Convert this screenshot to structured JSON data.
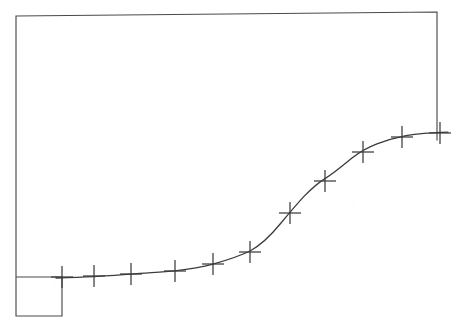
{
  "figure": {
    "title": "",
    "subtitle": "",
    "background_color": "#ffffff",
    "line_color": "#3c3c3c",
    "frame_color": "#4a4a4a",
    "marker_color": "#3c3c3c",
    "marker_symbol": "plus-cross"
  },
  "frame": {
    "top_left": [
      16,
      16
    ],
    "top_right": [
      437,
      12
    ],
    "right_bottom": [
      437,
      140
    ],
    "left_bottom": [
      16,
      316
    ],
    "notch_right": [
      62,
      316
    ],
    "notch_top": [
      62,
      277
    ],
    "path": "M 62 277 L 16 277 L 16 16 L 437 12 L 437 140 M 16 277 L 16 316 L 62 316 L 62 277"
  },
  "chart_data": {
    "type": "line",
    "title": "",
    "xlabel": "",
    "ylabel": "",
    "xlim": [
      0,
      12
    ],
    "ylim": [
      0,
      1
    ],
    "grid": false,
    "legend": null,
    "marker": "plus",
    "series": [
      {
        "name": "sigmoid",
        "x": [
          0,
          1,
          2,
          3,
          4,
          5,
          6,
          7,
          8,
          9,
          10,
          11
        ],
        "y": [
          0.0,
          0.015,
          0.03,
          0.055,
          0.1,
          0.175,
          0.3,
          0.47,
          0.64,
          0.77,
          0.865,
          0.9
        ],
        "pixel_points": [
          [
            62,
            277
          ],
          [
            94,
            276
          ],
          [
            131,
            274
          ],
          [
            175,
            271
          ],
          [
            213,
            264
          ],
          [
            250,
            252
          ],
          [
            290,
            213
          ],
          [
            325,
            181
          ],
          [
            363,
            152
          ],
          [
            402,
            137
          ],
          [
            440,
            133
          ]
        ]
      }
    ],
    "curve_path": "M 56 278 C 70 277.6 82 277.2 94 276.6 C 110 275.8 122 275 131 274.2 C 148 272.8 163 272.0 175 270.8 C 188 269.4 202 267.2 213 264.2 C 226 260.4 240 256.0 250 251.0 C 262 244.6 272 234.0 281 223.0 C 288 214.6 296 205.0 304 196.4 C 312 188.2 319 182.2 325 178.6 C 334 173.2 344 164.6 352 158.0 C 359 152.4 368 147.2 377 143.8 C 387 140.0 396 137.6 406 135.6 C 418 133.4 430 132.6 448 132.2"
  },
  "markers": {
    "count": 11,
    "arm_half_width": 11,
    "arm_half_height": 11,
    "items": [
      {
        "label": "point-1",
        "x": 62,
        "y": 277
      },
      {
        "label": "point-2",
        "x": 94,
        "y": 276
      },
      {
        "label": "point-3",
        "x": 131,
        "y": 274
      },
      {
        "label": "point-4",
        "x": 175,
        "y": 271
      },
      {
        "label": "point-5",
        "x": 213,
        "y": 264
      },
      {
        "label": "point-6",
        "x": 250,
        "y": 252
      },
      {
        "label": "point-7",
        "x": 290,
        "y": 213
      },
      {
        "label": "point-8",
        "x": 325,
        "y": 181
      },
      {
        "label": "point-9",
        "x": 363,
        "y": 152
      },
      {
        "label": "point-10",
        "x": 402,
        "y": 137
      },
      {
        "label": "point-11",
        "x": 440,
        "y": 133
      }
    ]
  }
}
